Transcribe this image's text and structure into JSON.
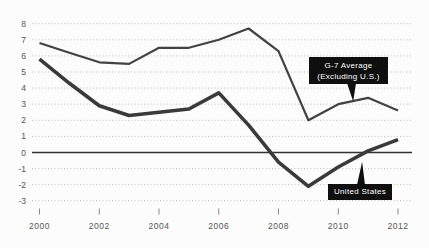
{
  "chart_data": {
    "type": "line",
    "x": [
      2000,
      2001,
      2002,
      2003,
      2004,
      2005,
      2006,
      2007,
      2008,
      2009,
      2010,
      2011,
      2012
    ],
    "series": [
      {
        "name": "G-7 Average (Excluding U.S.)",
        "values": [
          6.8,
          6.2,
          5.6,
          5.5,
          6.5,
          6.5,
          7.0,
          7.7,
          6.3,
          2.0,
          3.0,
          3.4,
          2.6
        ],
        "color": "#424242"
      },
      {
        "name": "United States",
        "values": [
          5.8,
          4.3,
          2.9,
          2.3,
          2.5,
          2.7,
          3.7,
          1.7,
          -0.6,
          -2.1,
          -0.9,
          0.1,
          0.8
        ],
        "color": "#3a3a3a"
      }
    ],
    "title": "",
    "xlabel": "",
    "ylabel": "",
    "ylim": [
      -3,
      8
    ],
    "yticks": [
      8,
      7,
      6,
      5,
      4,
      3,
      2,
      1,
      0,
      -1,
      -2,
      -3
    ],
    "xticks": [
      2000,
      2002,
      2004,
      2006,
      2008,
      2010,
      2012
    ],
    "grid": "horizontal-dotted",
    "zero_line": true,
    "legend_position": "none",
    "annotations": [
      {
        "target_series": "G-7 Average (Excluding U.S.)",
        "lines": [
          "G-7 Average",
          "(Excluding U.S.)"
        ],
        "anchor_year": 2010.5,
        "anchor_value": 3.1,
        "background": "#0f0f0f",
        "text_color": "#ffffff"
      },
      {
        "target_series": "United States",
        "lines": [
          "United States"
        ],
        "anchor_year": 2010.8,
        "anchor_value": -0.2,
        "background": "#0f0f0f",
        "text_color": "#ffffff"
      }
    ],
    "colors": {
      "background": "#fcfcfc",
      "gridline": "#bdbdbd",
      "zero_line": "#333333",
      "axis_label": "#555555",
      "tick_mark": "#8a8a8a"
    }
  }
}
